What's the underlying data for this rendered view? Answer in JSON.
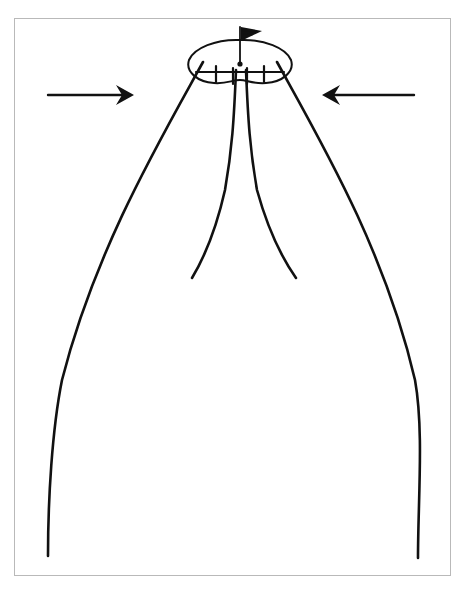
{
  "figure": {
    "background_color": "#ffffff",
    "ink_color": "#111111",
    "frame": {
      "name": "figure-border",
      "color": "#b9b9b9",
      "x": 14,
      "y": 18,
      "width": 437,
      "height": 558,
      "border_width": 1
    },
    "canopy": {
      "label": "parachute-canopy",
      "center_x": 240,
      "center_y": 62,
      "half_width": 52,
      "half_height": 22,
      "stroke_width": 2,
      "path": "M 240 40 C 264 39 286 48 291 60 C 295 72 282 82 266 83 C 252 84 247 80 240 80 C 232 80 227 84 214 83 C 198 82 185 72 189 60 C 194 48 216 39 240 40 Z"
    },
    "apex_dot": {
      "label": "canopy-apex-vent-dot",
      "cx": 240,
      "cy": 64,
      "r": 2.6
    },
    "mast": {
      "label": "flag-mast",
      "x": 240,
      "y_top": 27,
      "y_bottom": 64,
      "stroke_width": 1.8
    },
    "flag": {
      "label": "triangular-pennant",
      "path": "M 241 27 L 262 31 L 241 41 Z",
      "inner_marks": [
        "M 243 31 L 255 32",
        "M 244 34 L 252 35",
        "M 245 37 L 249 37"
      ]
    },
    "shroud_lines": {
      "label": "suspension-lines",
      "stroke_width": 2.6,
      "outer_left": "M 203 62 C 160 140 95 250 62 380 C 52 430 48 500 48 556",
      "outer_right": "M 277 62 C 320 140 385 250 415 380 C 424 430 418 500 418 558",
      "inner_left": "M 236 70 C 234 120 232 150 225 190 C 216 230 204 258 192 278",
      "inner_right": "M 246 70 C 248 120 250 150 257 190 C 268 230 282 258 296 278"
    },
    "canopy_skirt_marks": {
      "label": "canopy-skirt-attachment-bars",
      "stroke_width": 2.2,
      "segments": [
        "M 216 66 L 216 82",
        "M 264 66 L 264 82",
        "M 233 68 L 233 84",
        "M 247 68 L 247 84",
        "M 196 72 L 284 72"
      ]
    },
    "arrows": [
      {
        "name": "left-airflow-arrow",
        "direction": "right",
        "tail_x": 48,
        "tail_y": 95,
        "tip_x": 134,
        "tip_y": 95,
        "shaft_width": 2.4,
        "head_path": "M 134 95 L 116 85 L 122 95 L 116 105 Z"
      },
      {
        "name": "right-airflow-arrow",
        "direction": "left",
        "tail_x": 414,
        "tail_y": 95,
        "tip_x": 322,
        "tip_y": 95,
        "shaft_width": 2.4,
        "head_path": "M 322 95 L 340 85 L 334 95 L 340 105 Z"
      }
    ]
  }
}
